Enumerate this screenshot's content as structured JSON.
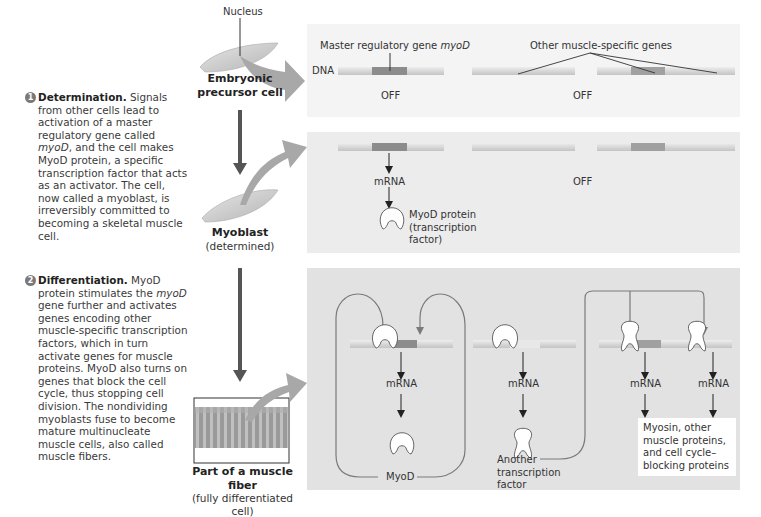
{
  "steps": [
    {
      "number": "1",
      "title": "Determination.",
      "text_parts": [
        " Signals from other cells lead to activation of a master regulatory gene called ",
        "myoD",
        ", and the cell makes MyoD protein, a specific transcription factor that acts as an activator. The cell, now called a myoblast, is irreversibly committed to becoming a skeletal muscle cell."
      ]
    },
    {
      "number": "2",
      "title": "Differentiation.",
      "text_parts": [
        " MyoD protein stimulates the ",
        "myoD",
        " gene further and activates genes encoding other muscle-specific transcription factors, which in turn activate genes for muscle proteins. MyoD also turns on genes that block the cell cycle, thus stopping cell division. The nondividing myoblasts fuse to become mature multinucleate muscle cells, also called muscle fibers."
      ]
    }
  ],
  "cells": {
    "nucleus_label": "Nucleus",
    "embryonic": {
      "title_line1": "Embryonic",
      "title_line2": "precursor cell"
    },
    "myoblast": {
      "title": "Myoblast",
      "subtitle": "(determined)"
    },
    "fiber": {
      "title": "Part of a muscle fiber",
      "subtitle": "(fully differentiated cell)"
    }
  },
  "panel1": {
    "dna_label": "DNA",
    "master_gene_label": "Master regulatory gene ",
    "master_gene_italic": "myoD",
    "other_genes_label": "Other muscle-specific genes",
    "off_label_1": "OFF",
    "off_label_2": "OFF"
  },
  "panel2": {
    "mrna_label": "mRNA",
    "off_label": "OFF",
    "protein_line1": "MyoD protein",
    "protein_line2": "(transcription",
    "protein_line3": "factor)"
  },
  "panel3": {
    "mrna_1": "mRNA",
    "mrna_2": "mRNA",
    "mrna_3": "mRNA",
    "mrna_4": "mRNA",
    "myod_label": "MyoD",
    "another_tf_line1": "Another",
    "another_tf_line2": "transcription",
    "another_tf_line3": "factor",
    "products_line1": "Myosin, other",
    "products_line2": "muscle proteins,",
    "products_line3": "and cell cycle–",
    "products_line4": "blocking proteins"
  },
  "colors": {
    "panel1_bg": "#f4f4f4",
    "panel2_bg": "#ececec",
    "panel3_bg": "#e2e2e2",
    "dna_light": "#dcdcdc",
    "gene_dark": "#8c8c8c",
    "gene_medium": "#a6a6a6",
    "arrow_gray": "#a8a8a8",
    "arrow_dark": "#555555",
    "line_gray": "#808080"
  }
}
